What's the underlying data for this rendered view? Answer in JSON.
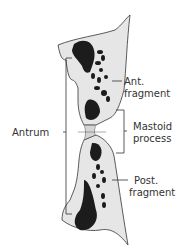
{
  "diagram": {
    "colors": {
      "bone": "#e6e6e6",
      "dark": "#1c1c1c",
      "line": "#333333",
      "background": "#ffffff"
    },
    "labels": {
      "ant_line1": "Ant.",
      "ant_line2": "fragment",
      "antrum": "Antrum",
      "mastoid_line1": "Mastoid",
      "mastoid_line2": "process",
      "post_line1": "Post.",
      "post_line2": "fragment"
    }
  }
}
